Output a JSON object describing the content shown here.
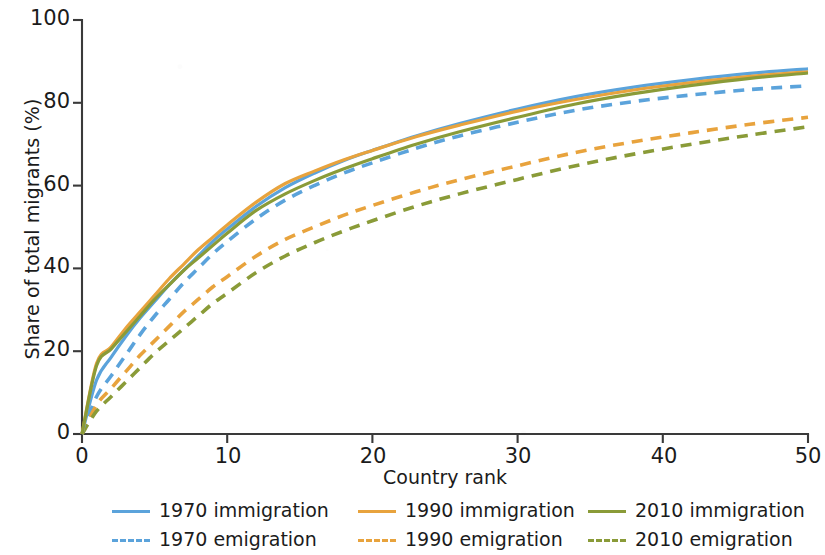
{
  "chart_data": {
    "type": "line",
    "title": "",
    "xlabel": "Country rank",
    "ylabel": "Share of total migrants (%)",
    "xlim": [
      0,
      50
    ],
    "ylim": [
      0,
      100
    ],
    "xticks": [
      "0",
      "10",
      "20",
      "30",
      "40",
      "50"
    ],
    "yticks": [
      "0",
      "20",
      "40",
      "60",
      "80",
      "100"
    ],
    "grid": false,
    "legend_position": "below",
    "x": [
      0,
      1,
      2,
      3,
      4,
      5,
      6,
      7,
      8,
      9,
      10,
      12,
      14,
      16,
      18,
      20,
      23,
      26,
      30,
      34,
      38,
      42,
      46,
      50
    ],
    "series": [
      {
        "name": "1970 immigration",
        "style": "solid",
        "color": "#5BA3DB",
        "values": [
          0,
          13,
          18.5,
          23.5,
          28,
          32,
          36,
          39.5,
          43,
          46.5,
          49.5,
          55,
          59.5,
          63,
          66,
          68.5,
          72,
          75,
          78.5,
          81.5,
          83.8,
          85.6,
          87.1,
          88.2
        ]
      },
      {
        "name": "1990 immigration",
        "style": "solid",
        "color": "#E8A33D",
        "values": [
          0,
          17,
          21,
          25.5,
          29.5,
          33.5,
          37.5,
          41,
          44.5,
          47.5,
          50.5,
          56,
          60.5,
          63.5,
          66.2,
          68.5,
          71.8,
          74.6,
          78,
          80.8,
          83.1,
          84.9,
          86.4,
          87.5
        ]
      },
      {
        "name": "2010 immigration",
        "style": "solid",
        "color": "#8A9B38",
        "values": [
          0,
          16.5,
          20.5,
          24.5,
          28.5,
          32.5,
          36,
          39.5,
          42.5,
          45.5,
          48.5,
          54,
          58,
          61.2,
          64,
          66.5,
          70,
          73,
          76.5,
          79.7,
          82.2,
          84.2,
          85.9,
          87.2
        ]
      },
      {
        "name": "1970 emigration",
        "style": "dashed",
        "color": "#5BA3DB",
        "values": [
          0,
          9,
          14,
          19,
          24,
          28.5,
          32.5,
          36.5,
          40,
          43.5,
          46.5,
          52,
          56.5,
          60,
          63,
          65.5,
          69,
          72,
          75.3,
          78.2,
          80.3,
          81.9,
          83.2,
          84.1
        ]
      },
      {
        "name": "1990 emigration",
        "style": "dashed",
        "color": "#E8A33D",
        "values": [
          0,
          7,
          11,
          15,
          19,
          22.5,
          26,
          29.5,
          32.5,
          35.5,
          38,
          43,
          47,
          50,
          52.8,
          55.2,
          58.5,
          61.4,
          64.8,
          68,
          70.6,
          72.8,
          74.8,
          76.5
        ]
      },
      {
        "name": "2010 emigration",
        "style": "dashed",
        "color": "#8A9B38",
        "values": [
          0,
          5.5,
          9,
          12.5,
          16,
          19.5,
          22.5,
          25.5,
          28.5,
          31.5,
          34,
          39,
          43,
          46.2,
          49,
          51.5,
          55,
          58,
          61.5,
          64.8,
          67.6,
          70,
          72.2,
          74.2
        ]
      }
    ]
  },
  "axes": {
    "ylabel": "Share of total migrants (%)",
    "xlabel": "Country rank",
    "yticks": [
      {
        "value": 100,
        "label": "100"
      },
      {
        "value": 80,
        "label": "80"
      },
      {
        "value": 60,
        "label": "60"
      },
      {
        "value": 40,
        "label": "40"
      },
      {
        "value": 20,
        "label": "20"
      },
      {
        "value": 0,
        "label": "0"
      }
    ],
    "xticks": [
      {
        "value": 0,
        "label": "0"
      },
      {
        "value": 10,
        "label": "10"
      },
      {
        "value": 20,
        "label": "20"
      },
      {
        "value": 30,
        "label": "30"
      },
      {
        "value": 40,
        "label": "40"
      },
      {
        "value": 50,
        "label": "50"
      }
    ]
  },
  "legend": {
    "items": [
      {
        "label": "1970 immigration",
        "color": "#5BA3DB",
        "style": "solid"
      },
      {
        "label": "1990 immigration",
        "color": "#E8A33D",
        "style": "solid"
      },
      {
        "label": "2010 immigration",
        "color": "#8A9B38",
        "style": "solid"
      },
      {
        "label": "1970 emigration",
        "color": "#5BA3DB",
        "style": "dashed"
      },
      {
        "label": "1990 emigration",
        "color": "#E8A33D",
        "style": "dashed"
      },
      {
        "label": "2010 emigration",
        "color": "#8A9B38",
        "style": "dashed"
      }
    ]
  },
  "colors": {
    "year_1970": "#5BA3DB",
    "year_1990": "#E8A33D",
    "year_2010": "#8A9B38",
    "axis": "#3a3a3a",
    "text": "#1b1b1b",
    "background": "#ffffff"
  }
}
